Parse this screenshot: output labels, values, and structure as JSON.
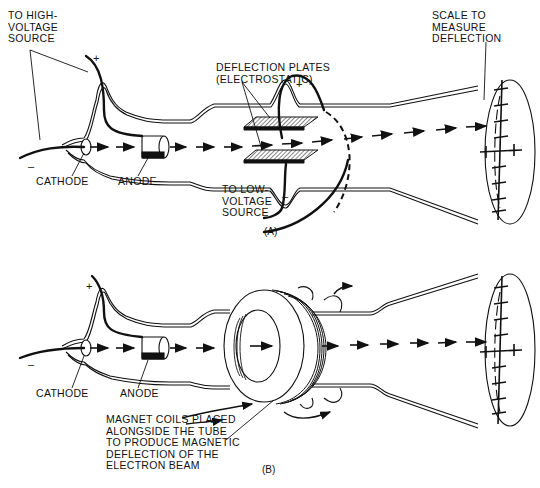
{
  "figure": {
    "panel_a": {
      "caption": "(A)",
      "labels": {
        "high_voltage": "TO HIGH-\nVOLTAGE\nSOURCE",
        "deflection_plates": "DEFLECTION PLATES\n(ELECTROSTATIC)",
        "scale": "SCALE TO\nMEASURE\nDEFLECTION",
        "cathode": "CATHODE",
        "anode": "ANODE",
        "low_voltage": "TO LOW-\nVOLTAGE\nSOURCE"
      },
      "signs": {
        "hv_plus": "+",
        "hv_minus": "–",
        "plate_plus": "+",
        "plate_minus": "–"
      }
    },
    "panel_b": {
      "caption": "(B)",
      "labels": {
        "cathode": "CATHODE",
        "anode": "ANODE",
        "magnet_coils": "MAGNET COILS PLACED\nALONGSIDE THE TUBE\nTO PRODUCE MAGNETIC\nDEFLECTION OF THE\nELECTRON BEAM"
      },
      "signs": {
        "plus": "+",
        "minus": "–"
      }
    },
    "colors": {
      "ink": "#111111",
      "background": "#ffffff"
    }
  }
}
